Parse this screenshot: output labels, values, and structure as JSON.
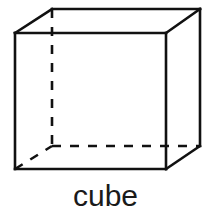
{
  "figure": {
    "label": "cube",
    "shape_name": "cube",
    "kind": "3d-solid-line-drawing",
    "projection": "oblique-cabinet",
    "background_color": "#ffffff",
    "line_color": "#111111",
    "label_color": "#1a1a1a",
    "stroke_width_px": 2.6,
    "hidden_edge_style": "dashed",
    "hidden_edge_dash_pattern": "9 9",
    "visible_edge_style": "solid",
    "vertices": {
      "front_top_left": [
        15,
        33
      ],
      "front_top_right": [
        166,
        33
      ],
      "front_bottom_right": [
        166,
        169
      ],
      "front_bottom_left": [
        15,
        169
      ],
      "back_top_left": [
        52,
        9
      ],
      "back_top_right": [
        200,
        9
      ],
      "back_bottom_right": [
        200,
        146
      ],
      "back_bottom_left": [
        52,
        146
      ]
    },
    "visible_edges": [
      "front_top_left-front_top_right",
      "front_top_right-front_bottom_right",
      "front_bottom_right-front_bottom_left",
      "front_bottom_left-front_top_left",
      "back_top_left-back_top_right",
      "back_top_right-back_bottom_right",
      "front_top_left-back_top_left",
      "front_top_right-back_top_right",
      "front_bottom_right-back_bottom_right"
    ],
    "hidden_edges": [
      "back_bottom_left-back_top_left",
      "back_bottom_left-back_bottom_right",
      "back_bottom_left-front_bottom_left"
    ],
    "edge_counts": {
      "visible": 9,
      "hidden": 3,
      "total": 12
    },
    "vertex_count": 8,
    "face_count": 6
  }
}
